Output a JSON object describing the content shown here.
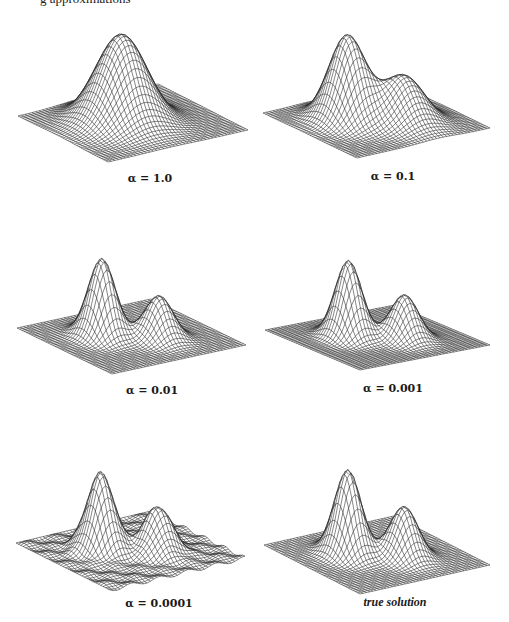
{
  "header": {
    "partial_caption": "g   approximations"
  },
  "figure": {
    "panels": [
      {
        "label": "α = 1.0",
        "alpha": 1.0,
        "shape": "single broad peak"
      },
      {
        "label": "α = 0.1",
        "alpha": 0.1,
        "shape": "main peak with shoulder"
      },
      {
        "label": "α = 0.01",
        "alpha": 0.01,
        "shape": "two peaks"
      },
      {
        "label": "α = 0.001",
        "alpha": 0.001,
        "shape": "two peaks"
      },
      {
        "label": "α = 0.0001",
        "alpha": 0.0001,
        "shape": "two peaks, slight ripples"
      },
      {
        "label": "true solution",
        "alpha": null,
        "shape": "two peaks"
      }
    ]
  },
  "chart_data": [
    {
      "type": "surface",
      "title": "α = 1.0",
      "peaks": [
        {
          "height": 1.0,
          "width": "broad"
        }
      ]
    },
    {
      "type": "surface",
      "title": "α = 0.1",
      "peaks": [
        {
          "height": 1.0
        },
        {
          "height": 0.55,
          "kind": "shoulder"
        }
      ]
    },
    {
      "type": "surface",
      "title": "α = 0.01",
      "peaks": [
        {
          "height": 1.0
        },
        {
          "height": 0.55
        }
      ]
    },
    {
      "type": "surface",
      "title": "α = 0.001",
      "peaks": [
        {
          "height": 1.0
        },
        {
          "height": 0.58
        }
      ]
    },
    {
      "type": "surface",
      "title": "α = 0.0001",
      "peaks": [
        {
          "height": 1.0
        },
        {
          "height": 0.58
        }
      ]
    },
    {
      "type": "surface",
      "title": "true solution",
      "peaks": [
        {
          "height": 1.0
        },
        {
          "height": 0.6
        }
      ]
    }
  ]
}
